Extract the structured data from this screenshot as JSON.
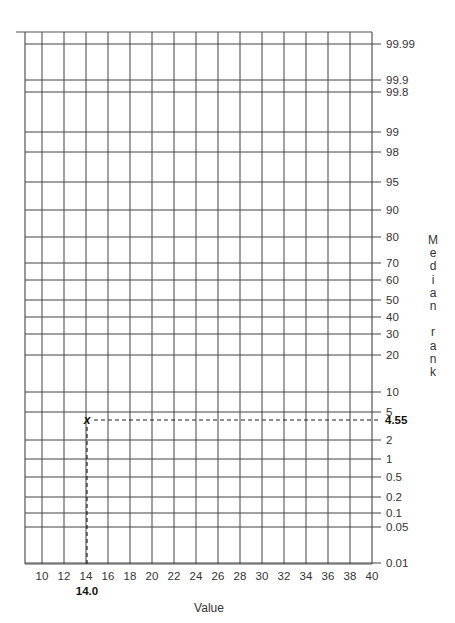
{
  "chart_data": {
    "type": "scatter",
    "title": "",
    "subtitle": "Probability plotting paper (median rank scale)",
    "xlabel": "Value",
    "ylabel": "Median rank",
    "x_ticks": [
      10,
      12,
      14,
      16,
      18,
      20,
      22,
      24,
      26,
      28,
      30,
      32,
      34,
      36,
      38,
      40
    ],
    "x_tick_labels": [
      "10",
      "12",
      "14",
      "16",
      "18",
      "20",
      "22",
      "24",
      "26",
      "28",
      "30",
      "32",
      "34",
      "36",
      "38",
      "40"
    ],
    "y_ticks": [
      99.99,
      99.9,
      99.8,
      99,
      98,
      95,
      90,
      80,
      70,
      60,
      50,
      40,
      30,
      20,
      10,
      5,
      2,
      1,
      0.5,
      0.2,
      0.1,
      0.05,
      0.01
    ],
    "y_tick_labels": [
      "99.99",
      "99.9",
      "99.8",
      "99",
      "98",
      "95",
      "90",
      "80",
      "70",
      "60",
      "50",
      "40",
      "30",
      "20",
      "10",
      "5",
      "2",
      "1",
      "0.5",
      "0.2",
      "0.1",
      "0.05",
      "0.01"
    ],
    "xlim": [
      10,
      40
    ],
    "ylim": [
      0.01,
      99.99
    ],
    "y_scale": "probability",
    "grid": true,
    "legend": null,
    "points": [
      {
        "x": 14.0,
        "y": 4.55,
        "marker": "x"
      }
    ],
    "annotations": [
      {
        "text": "14.0",
        "position": "below x-axis at x=14",
        "bold": true
      },
      {
        "text": "4.55",
        "position": "right y-axis at y=4.55",
        "bold": true
      }
    ],
    "reference_lines": [
      {
        "type": "vertical-dashed",
        "x": 14.0,
        "from_y": 4.55,
        "to_y": 0.01
      },
      {
        "type": "horizontal-dashed",
        "y": 4.55,
        "from_x": 14.0,
        "to_x": 40
      }
    ]
  },
  "labels": {
    "xlabel": "Value",
    "ylabel_vertical": "M\ne\nd\ni\na\nn\n \nr\na\nn\nk",
    "point_marker": "x",
    "x_annotation": "14.0",
    "y_annotation": "4.55"
  },
  "y_gridlines": [
    {
      "label": "99.99",
      "y": 44
    },
    {
      "label": "99.9",
      "y": 80
    },
    {
      "label": "99.8",
      "y": 92
    },
    {
      "label": "99",
      "y": 132
    },
    {
      "label": "98",
      "y": 152
    },
    {
      "label": "95",
      "y": 182
    },
    {
      "label": "90",
      "y": 210
    },
    {
      "label": "80",
      "y": 237
    },
    {
      "label": "70",
      "y": 263
    },
    {
      "label": "60",
      "y": 280
    },
    {
      "label": "50",
      "y": 300
    },
    {
      "label": "40",
      "y": 317
    },
    {
      "label": "30",
      "y": 334
    },
    {
      "label": "20",
      "y": 355
    },
    {
      "label": "10",
      "y": 392
    },
    {
      "label": "5",
      "y": 412
    },
    {
      "label": "2",
      "y": 440
    },
    {
      "label": "1",
      "y": 459
    },
    {
      "label": "0.5",
      "y": 477
    },
    {
      "label": "0.2",
      "y": 497
    },
    {
      "label": "0.1",
      "y": 513
    },
    {
      "label": "0.05",
      "y": 527
    },
    {
      "label": "0.01",
      "y": 563
    }
  ]
}
